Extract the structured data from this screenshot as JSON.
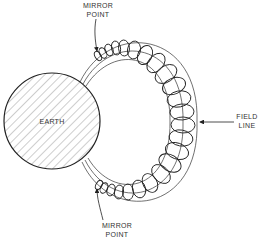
{
  "diagram": {
    "type": "magnetosphere particle trapping diagram",
    "labels": {
      "earth": "EARTH",
      "top_mirror": [
        "MIRROR",
        "POINT"
      ],
      "bottom_mirror": [
        "MIRROR",
        "POINT"
      ],
      "field_line": [
        "FIELD",
        "LINE"
      ]
    },
    "colors": {
      "line": "#222222",
      "background": "#ffffff",
      "hatch": "#555555"
    }
  }
}
